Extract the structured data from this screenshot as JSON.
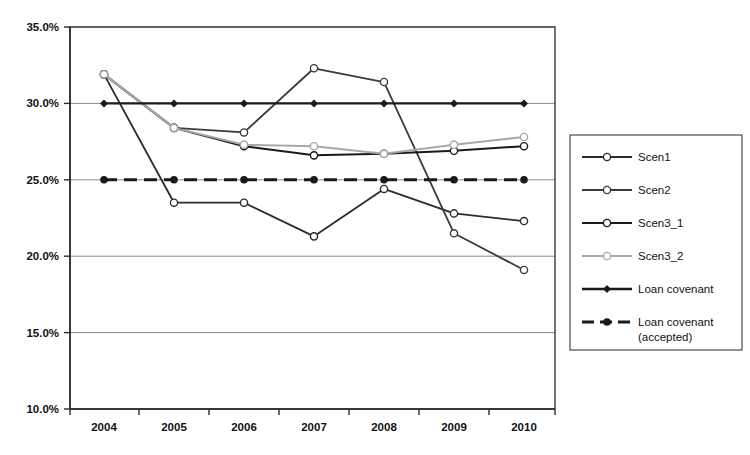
{
  "chart_data": {
    "type": "line",
    "title": "",
    "xlabel": "",
    "ylabel": "",
    "categories": [
      "2004",
      "2005",
      "2006",
      "2007",
      "2008",
      "2009",
      "2010"
    ],
    "x_tick_labels": [
      "2004",
      "2005",
      "2006",
      "2007",
      "2008",
      "2009",
      "2010"
    ],
    "y_tick_labels": [
      "10.0%",
      "15.0%",
      "20.0%",
      "25.0%",
      "30.0%",
      "35.0%"
    ],
    "y_tick_values": [
      10.0,
      15.0,
      20.0,
      25.0,
      30.0,
      35.0
    ],
    "ylim": [
      10.0,
      35.0
    ],
    "y_unit": "%",
    "grid": true,
    "legend_position": "right",
    "series": [
      {
        "name": "Scen1",
        "values": [
          31.9,
          23.5,
          23.5,
          21.3,
          24.4,
          22.8,
          22.3
        ],
        "color": "#2b2b2b",
        "marker": "circle-hollow",
        "dash": "solid",
        "width": 1.8
      },
      {
        "name": "Scen2",
        "values": [
          31.9,
          28.4,
          28.1,
          32.3,
          31.4,
          21.5,
          19.1
        ],
        "color": "#3a3a3a",
        "marker": "circle-hollow",
        "dash": "solid",
        "width": 1.8
      },
      {
        "name": "Scen3_1",
        "values": [
          31.9,
          28.4,
          27.2,
          26.6,
          26.7,
          26.9,
          27.2
        ],
        "color": "#1a1a1a",
        "marker": "circle-hollow",
        "dash": "solid",
        "width": 2.0
      },
      {
        "name": "Scen3_2",
        "values": [
          31.9,
          28.4,
          27.3,
          27.2,
          26.7,
          27.3,
          27.8
        ],
        "color": "#a8a8a8",
        "marker": "circle-hollow",
        "dash": "solid",
        "width": 2.0
      },
      {
        "name": "Loan covenant",
        "values": [
          30.0,
          30.0,
          30.0,
          30.0,
          30.0,
          30.0,
          30.0
        ],
        "color": "#1a1a1a",
        "marker": "diamond-solid",
        "dash": "solid",
        "width": 2.4
      },
      {
        "name": "Loan covenant (accepted)",
        "values": [
          25.0,
          25.0,
          25.0,
          25.0,
          25.0,
          25.0,
          25.0
        ],
        "color": "#1a1a1a",
        "marker": "circle-solid",
        "dash": "dashed",
        "width": 3.0
      }
    ]
  },
  "legend": {
    "entries": [
      {
        "label": "Scen1",
        "label2": ""
      },
      {
        "label": "Scen2",
        "label2": ""
      },
      {
        "label": "Scen3_1",
        "label2": ""
      },
      {
        "label": "Scen3_2",
        "label2": ""
      },
      {
        "label": "Loan covenant",
        "label2": ""
      },
      {
        "label": "Loan covenant",
        "label2": "(accepted)"
      }
    ]
  },
  "colors": {
    "background": "#ffffff",
    "axis": "#2b2b2b",
    "grid": "#8a8a8a",
    "text": "#111111",
    "series_light_gray": "#a8a8a8",
    "series_dark": "#1a1a1a"
  }
}
